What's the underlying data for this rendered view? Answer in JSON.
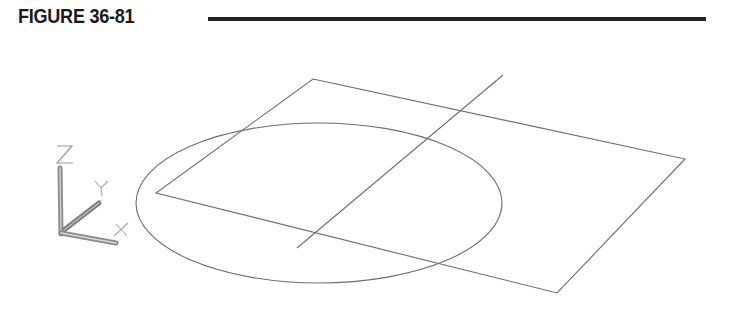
{
  "figure": {
    "label": "FIGURE 36-81"
  },
  "colors": {
    "header_text": "#1a1a1a",
    "rule": "#222222",
    "wire_line": "#6e6e6e",
    "ucs_axis": "#7a7a7a",
    "ucs_label": "#9a9a9a",
    "background": "#ffffff"
  },
  "drawing": {
    "parallelogram": {
      "points": [
        [
          313,
          79
        ],
        [
          685,
          159
        ],
        [
          557,
          293
        ],
        [
          156,
          193
        ]
      ]
    },
    "diagonal_line": {
      "start": [
        503,
        75
      ],
      "end": [
        297,
        248
      ]
    },
    "ellipse": {
      "cx": 319,
      "cy": 203,
      "rx": 183,
      "ry": 80
    }
  },
  "ucs_icon": {
    "axes": {
      "z": {
        "label": "Z",
        "from": [
          61,
          234
        ],
        "to": [
          60,
          168
        ]
      },
      "y": {
        "label": "Y",
        "from": [
          64,
          230
        ],
        "to": [
          99,
          203
        ]
      },
      "x": {
        "label": "X",
        "from": [
          61,
          233
        ],
        "to": [
          116,
          243
        ]
      }
    }
  }
}
